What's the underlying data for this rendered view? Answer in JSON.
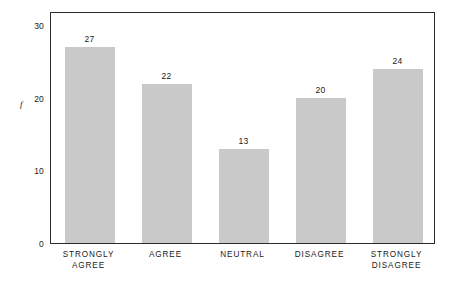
{
  "chart_data": {
    "type": "bar",
    "title": "",
    "subtitle": "",
    "xlabel": "",
    "ylabel": "f",
    "categories": [
      "STRONGLY\nAGREE",
      "AGREE",
      "NEUTRAL",
      "DISAGREE",
      "STRONGLY\nDISAGREE"
    ],
    "values": [
      27,
      22,
      13,
      20,
      24
    ],
    "value_labels": [
      "27",
      "22",
      "13",
      "20",
      "24"
    ],
    "ylim": [
      0,
      32
    ],
    "yticks": [
      0,
      10,
      20,
      30
    ],
    "ytick_labels": [
      "0",
      "10",
      "20",
      "30"
    ],
    "grid": false,
    "legend": null,
    "bar_color": "#c9c9c9",
    "frame_color": "#2b2b2b",
    "text_color": "#1a1a1a"
  }
}
